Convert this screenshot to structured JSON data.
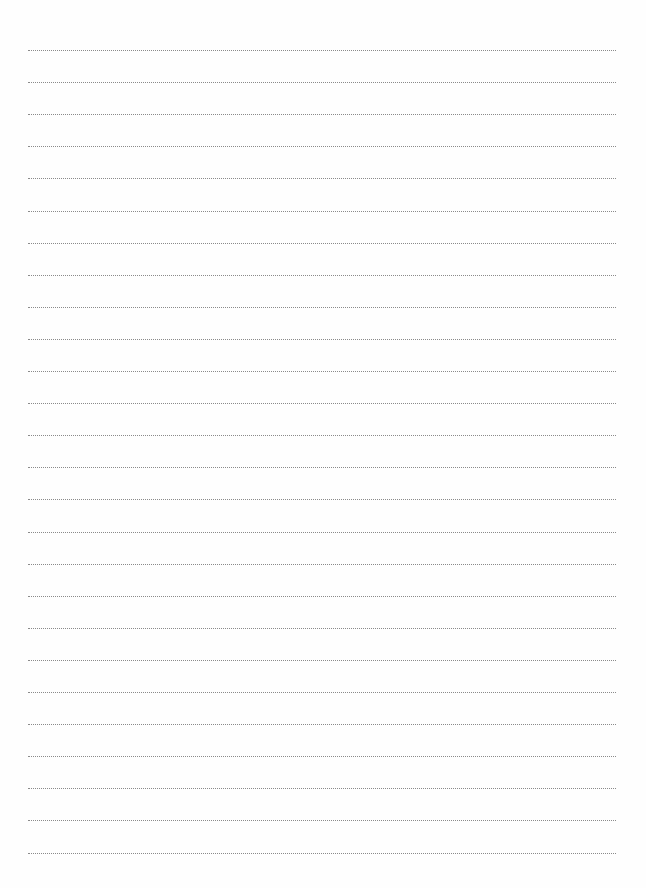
{
  "page": {
    "type": "lined-paper",
    "line_count": 26,
    "first_line_y": 50,
    "line_spacing": 32.1,
    "line_left": 28,
    "line_right": 616,
    "line_style": "dotted",
    "line_color": "#8a8a8a",
    "background": "#fefefe"
  }
}
